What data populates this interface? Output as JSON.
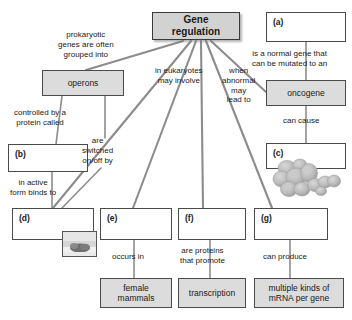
{
  "diagram": {
    "colors": {
      "node_fill_shaded": "#dcdcdc",
      "node_fill_blank": "#ffffff",
      "root_fill": "#d2d2d2",
      "border": "#4a4a4a",
      "edge": "#8c8c8c",
      "text": "#1a1a1a",
      "background": "#ffffff"
    },
    "nodes": [
      {
        "id": "root",
        "label": "Gene\nregulation",
        "line1": "Gene",
        "line2": "regulation",
        "style": "root",
        "x": 152,
        "y": 12,
        "w": 88,
        "h": 28
      },
      {
        "id": "operons",
        "label": "operons",
        "line1": "operons",
        "line2": "",
        "style": "filled",
        "x": 42,
        "y": 70,
        "w": 82,
        "h": 26
      },
      {
        "id": "a",
        "label": "(a)",
        "line1": "(a)",
        "line2": "",
        "style": "blank",
        "x": 266,
        "y": 12,
        "w": 80,
        "h": 30
      },
      {
        "id": "oncogene",
        "label": "oncogene",
        "line1": "oncogene",
        "line2": "",
        "style": "filled",
        "x": 266,
        "y": 80,
        "w": 80,
        "h": 26
      },
      {
        "id": "c",
        "label": "(c)",
        "line1": "(c)",
        "line2": "",
        "style": "blank",
        "x": 266,
        "y": 143,
        "w": 80,
        "h": 26
      },
      {
        "id": "b",
        "label": "(b)",
        "line1": "(b)",
        "line2": "",
        "style": "blank",
        "x": 8,
        "y": 144,
        "w": 80,
        "h": 28
      },
      {
        "id": "d",
        "label": "(d)",
        "line1": "(d)",
        "line2": "",
        "style": "blank",
        "x": 12,
        "y": 208,
        "w": 82,
        "h": 32
      },
      {
        "id": "e",
        "label": "(e)",
        "line1": "(e)",
        "line2": "",
        "style": "blank",
        "x": 100,
        "y": 208,
        "w": 72,
        "h": 32
      },
      {
        "id": "f",
        "label": "(f)",
        "line1": "(f)",
        "line2": "",
        "style": "blank",
        "x": 178,
        "y": 208,
        "w": 68,
        "h": 32
      },
      {
        "id": "g",
        "label": "(g)",
        "line1": "(g)",
        "line2": "",
        "style": "blank",
        "x": 254,
        "y": 208,
        "w": 74,
        "h": 32
      },
      {
        "id": "female",
        "label": "female mammals",
        "line1": "female",
        "line2": "mammals",
        "style": "filled",
        "x": 100,
        "y": 278,
        "w": 72,
        "h": 30
      },
      {
        "id": "transcription",
        "label": "transcription",
        "line1": "transcription",
        "line2": "",
        "style": "filled",
        "x": 178,
        "y": 278,
        "w": 68,
        "h": 30
      },
      {
        "id": "mrna",
        "label": "multiple kinds of mRNA per gene",
        "line1": "multiple kinds of",
        "line2": "mRNA per gene",
        "style": "filled",
        "x": 254,
        "y": 278,
        "w": 90,
        "h": 30
      }
    ],
    "edge_labels": [
      {
        "id": "lbl-prokaryotic",
        "text": "prokaryotic\ngenes are often\ngrouped into",
        "lines": [
          "prokaryotic",
          "genes are often",
          "grouped into"
        ],
        "x": 58,
        "y": 32
      },
      {
        "id": "lbl-eukaryotes",
        "text": "in eukaryotes\nmay involve",
        "lines": [
          "in eukaryotes",
          "may involve"
        ],
        "x": 156,
        "y": 68
      },
      {
        "id": "lbl-abnormal",
        "text": "when\nabnormal\nmay\nlead to",
        "lines": [
          "when",
          "abnormal",
          "may",
          "lead to"
        ],
        "x": 222,
        "y": 68
      },
      {
        "id": "lbl-normalgene",
        "text": "is a normal gene that\ncan be mutated to an",
        "lines": [
          "is a normal gene that",
          "can be mutated to an"
        ],
        "x": 252,
        "y": 50
      },
      {
        "id": "lbl-cancause",
        "text": "can cause",
        "lines": [
          "can cause"
        ],
        "x": 284,
        "y": 118
      },
      {
        "id": "lbl-controlled",
        "text": "controlled by a\nprotein called",
        "lines": [
          "controlled by a",
          "protein called"
        ],
        "x": 16,
        "y": 110
      },
      {
        "id": "lbl-switched",
        "text": "are\nswitched\non/off by",
        "lines": [
          "are",
          "switched",
          "on/off by"
        ],
        "x": 84,
        "y": 138
      },
      {
        "id": "lbl-activeform",
        "text": "in active\nform binds to",
        "lines": [
          "in active",
          "form binds to"
        ],
        "x": 14,
        "y": 180
      },
      {
        "id": "lbl-occursin",
        "text": "occurs in",
        "lines": [
          "occurs in"
        ],
        "x": 113,
        "y": 254
      },
      {
        "id": "lbl-areproteins",
        "text": "are proteins\nthat promote",
        "lines": [
          "are proteins",
          "that promote"
        ],
        "x": 181,
        "y": 248
      },
      {
        "id": "lbl-canproduce",
        "text": "can produce",
        "lines": [
          "can produce"
        ],
        "x": 265,
        "y": 254
      }
    ],
    "images": [
      {
        "id": "tumor-cells-image",
        "alt": "cluster of rounded tumor cells",
        "x": 272,
        "y": 160,
        "w": 68,
        "h": 40
      },
      {
        "id": "gel-band-image",
        "alt": "framed micrograph thumbnail",
        "x": 62,
        "y": 232,
        "w": 33,
        "h": 24
      }
    ],
    "edges": [
      {
        "from": "root",
        "to": "operons",
        "label_id": "lbl-prokaryotic"
      },
      {
        "from": "root",
        "to": "d",
        "label_id": "lbl-eukaryotes"
      },
      {
        "from": "root",
        "to": "e",
        "label_id": "lbl-eukaryotes"
      },
      {
        "from": "root",
        "to": "f",
        "label_id": "lbl-eukaryotes"
      },
      {
        "from": "root",
        "to": "g",
        "label_id": "lbl-abnormal"
      },
      {
        "from": "root",
        "to": "oncogene",
        "label_id": "lbl-abnormal"
      },
      {
        "from": "a",
        "to": "oncogene",
        "label_id": "lbl-normalgene"
      },
      {
        "from": "oncogene",
        "to": "c",
        "label_id": "lbl-cancause"
      },
      {
        "from": "operons",
        "to": "b",
        "label_id": "lbl-controlled"
      },
      {
        "from": "operons",
        "to": "d",
        "label_id": "lbl-switched"
      },
      {
        "from": "b",
        "to": "d",
        "label_id": "lbl-activeform"
      },
      {
        "from": "e",
        "to": "female",
        "label_id": "lbl-occursin"
      },
      {
        "from": "f",
        "to": "transcription",
        "label_id": "lbl-areproteins"
      },
      {
        "from": "g",
        "to": "mrna",
        "label_id": "lbl-canproduce"
      }
    ]
  }
}
